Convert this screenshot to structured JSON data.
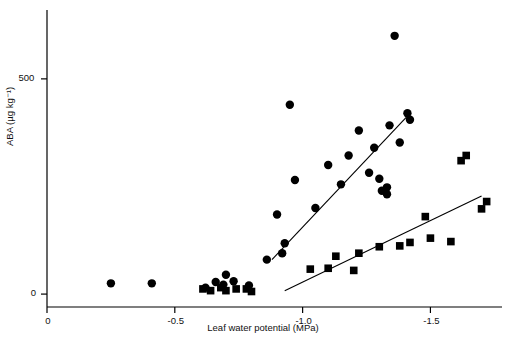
{
  "chart_data": {
    "type": "scatter",
    "title": "",
    "xlabel": "Leaf water potential (MPa)",
    "ylabel": "ABA (µg kg⁻¹)",
    "xlim": [
      0,
      -1.78
    ],
    "ylim": [
      -30,
      660
    ],
    "xticks": [
      {
        "value": 0,
        "label": "0"
      },
      {
        "value": -0.5,
        "label": "-0.5"
      },
      {
        "value": -1.0,
        "label": "-1.0"
      },
      {
        "value": -1.5,
        "label": "-1.5"
      }
    ],
    "yticks": [
      {
        "value": 0,
        "label": "0"
      },
      {
        "value": 500,
        "label": "500"
      }
    ],
    "grid": false,
    "legend": "none",
    "series": [
      {
        "name": "circles",
        "marker": "filled-circle",
        "color": "#000000",
        "points": [
          [
            -0.25,
            25
          ],
          [
            -0.41,
            25
          ],
          [
            -0.62,
            15
          ],
          [
            -0.66,
            28
          ],
          [
            -0.69,
            22
          ],
          [
            -0.7,
            45
          ],
          [
            -0.73,
            30
          ],
          [
            -0.79,
            20
          ],
          [
            -0.86,
            80
          ],
          [
            -0.9,
            185
          ],
          [
            -0.92,
            95
          ],
          [
            -0.93,
            118
          ],
          [
            -0.95,
            440
          ],
          [
            -0.97,
            265
          ],
          [
            -1.05,
            200
          ],
          [
            -1.1,
            300
          ],
          [
            -1.15,
            255
          ],
          [
            -1.18,
            322
          ],
          [
            -1.22,
            380
          ],
          [
            -1.26,
            282
          ],
          [
            -1.28,
            340
          ],
          [
            -1.3,
            268
          ],
          [
            -1.31,
            240
          ],
          [
            -1.33,
            248
          ],
          [
            -1.33,
            232
          ],
          [
            -1.34,
            392
          ],
          [
            -1.36,
            600
          ],
          [
            -1.38,
            352
          ],
          [
            -1.41,
            420
          ],
          [
            -1.42,
            405
          ]
        ]
      },
      {
        "name": "squares",
        "marker": "filled-square",
        "color": "#000000",
        "points": [
          [
            -0.61,
            12
          ],
          [
            -0.64,
            8
          ],
          [
            -0.68,
            15
          ],
          [
            -0.7,
            8
          ],
          [
            -0.74,
            12
          ],
          [
            -0.78,
            12
          ],
          [
            -0.8,
            6
          ],
          [
            -1.03,
            58
          ],
          [
            -1.1,
            60
          ],
          [
            -1.13,
            88
          ],
          [
            -1.2,
            55
          ],
          [
            -1.22,
            95
          ],
          [
            -1.3,
            110
          ],
          [
            -1.38,
            112
          ],
          [
            -1.42,
            120
          ],
          [
            -1.48,
            180
          ],
          [
            -1.5,
            130
          ],
          [
            -1.58,
            122
          ],
          [
            -1.62,
            310
          ],
          [
            -1.64,
            322
          ],
          [
            -1.7,
            198
          ],
          [
            -1.72,
            215
          ]
        ]
      }
    ],
    "fit_lines": [
      {
        "name": "circle-regression",
        "x1": -0.88,
        "y1": 80,
        "x2": -1.42,
        "y2": 420
      },
      {
        "name": "square-regression",
        "x1": -0.93,
        "y1": 8,
        "x2": -1.7,
        "y2": 228
      }
    ]
  }
}
